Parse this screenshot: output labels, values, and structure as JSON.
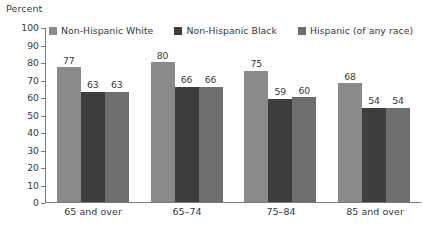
{
  "chart_data": {
    "type": "bar",
    "title": "",
    "subtitle": "",
    "xlabel": "",
    "ylabel": "Percent",
    "ylim": [
      0,
      100
    ],
    "ytick_step": 10,
    "yticks": [
      100,
      90,
      80,
      70,
      60,
      50,
      40,
      30,
      20,
      10,
      0
    ],
    "grid": false,
    "legend_position": "top",
    "categories": [
      "65 and over",
      "65–74",
      "75–84",
      "85 and over"
    ],
    "series": [
      {
        "name": "Non-Hispanic White",
        "color": "#8a8a8a",
        "values": [
          77,
          80,
          75,
          68
        ]
      },
      {
        "name": "Non-Hispanic Black",
        "color": "#3d3d3d",
        "values": [
          63,
          66,
          59,
          54
        ]
      },
      {
        "name": "Hispanic (of any race)",
        "color": "#6e6e6e",
        "values": [
          63,
          66,
          60,
          54
        ]
      }
    ]
  },
  "axis": {
    "y_title": "Percent"
  },
  "colors": {
    "axis": "#7a7a7a",
    "text": "#33383d",
    "background": "#ffffff"
  }
}
